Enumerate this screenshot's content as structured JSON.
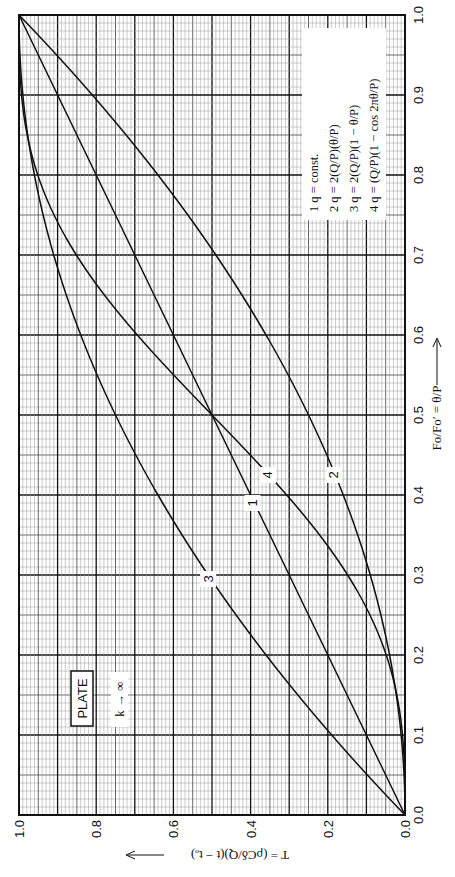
{
  "chart_data": {
    "type": "line",
    "orientation": "rotated-90deg-ccw",
    "title": "",
    "annotation_box": "PLATE",
    "annotation_sub": "k → ∞",
    "xlabel": "Fo/Fo′ = θ/P",
    "ylabel": "T = (ρCδ/Q)(t − tₒ)",
    "xlim": [
      0.0,
      1.0
    ],
    "ylim": [
      0.0,
      1.0
    ],
    "x_ticks": [
      "0.0",
      "0.1",
      "0.2",
      "0.3",
      "0.4",
      "0.5",
      "0.6",
      "0.7",
      "0.8",
      "0.9",
      "1.0"
    ],
    "y_ticks": [
      "0.0",
      "0.2",
      "0.4",
      "0.6",
      "0.8",
      "1.0"
    ],
    "grid": {
      "major": 0.1,
      "mid": 0.05,
      "minor": 0.01
    },
    "legend_position": "upper-right (rotated)",
    "legend": [
      {
        "id": "1",
        "text": "1   q = const."
      },
      {
        "id": "2",
        "text": "2   q = 2(Q/P)(θ/P)"
      },
      {
        "id": "3",
        "text": "3   q = 2(Q/P)(1 − θ/P)"
      },
      {
        "id": "4",
        "text": "4   q = (Q/P)(1 − cos 2πθ/P)"
      }
    ],
    "x": [
      0.0,
      0.1,
      0.2,
      0.3,
      0.4,
      0.5,
      0.6,
      0.7,
      0.8,
      0.9,
      1.0
    ],
    "series": [
      {
        "name": "1",
        "values": [
          0.0,
          0.1,
          0.2,
          0.3,
          0.4,
          0.5,
          0.6,
          0.7,
          0.8,
          0.9,
          1.0
        ],
        "label_at": {
          "x": 0.39,
          "y": 0.395
        }
      },
      {
        "name": "2",
        "values": [
          0.0,
          0.01,
          0.04,
          0.09,
          0.16,
          0.25,
          0.36,
          0.49,
          0.64,
          0.81,
          1.0
        ],
        "label_at": {
          "x": 0.425,
          "y": 0.185
        }
      },
      {
        "name": "3",
        "values": [
          0.0,
          0.19,
          0.36,
          0.51,
          0.64,
          0.75,
          0.84,
          0.91,
          0.96,
          0.99,
          1.0
        ],
        "label_at": {
          "x": 0.295,
          "y": 0.51
        }
      },
      {
        "name": "4",
        "values": [
          0.0,
          0.006,
          0.049,
          0.149,
          0.306,
          0.5,
          0.694,
          0.851,
          0.951,
          0.994,
          1.0
        ],
        "label_at": {
          "x": 0.425,
          "y": 0.355
        }
      }
    ]
  }
}
